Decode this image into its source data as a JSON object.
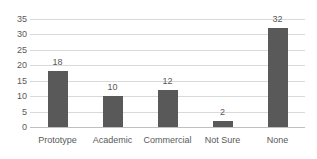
{
  "chart_data": {
    "type": "bar",
    "title": "",
    "subtitle": "",
    "xlabel": "",
    "ylabel": "",
    "categories": [
      "Prototype",
      "Academic",
      "Commercial",
      "Not Sure",
      "None"
    ],
    "values": [
      18,
      10,
      12,
      2,
      32
    ],
    "data_labels": [
      "18",
      "10",
      "12",
      "2",
      "32"
    ],
    "ylim": [
      0,
      35
    ],
    "ytick_step": 5,
    "ytick_labels": [
      "0",
      "5",
      "10",
      "15",
      "20",
      "25",
      "30",
      "35"
    ],
    "grid": {
      "horizontal": true,
      "vertical": false
    },
    "legend": {
      "visible": false,
      "position": "none",
      "entries": []
    },
    "colors": {
      "bar": "#595959",
      "text": "#595959",
      "gridline": "#d9d9d9",
      "axis_line": "#bfbfbf",
      "background": "#ffffff"
    }
  }
}
